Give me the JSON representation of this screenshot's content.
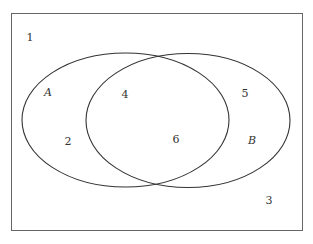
{
  "diagram": {
    "type": "venn",
    "sets": [
      {
        "name": "A",
        "label": "A"
      },
      {
        "name": "B",
        "label": "B"
      }
    ],
    "regions": {
      "outside": [
        "1",
        "3"
      ],
      "A_only": "2",
      "A_and_B": [
        "4",
        "6"
      ],
      "B_only": "5"
    },
    "labels": {
      "n1": "1",
      "n2": "2",
      "n3": "3",
      "n4": "4",
      "n5": "5",
      "n6": "6",
      "setA": "A",
      "setB": "B"
    },
    "colors": {
      "stroke": "#333333",
      "frame": "#666666",
      "background": "#ffffff"
    }
  }
}
